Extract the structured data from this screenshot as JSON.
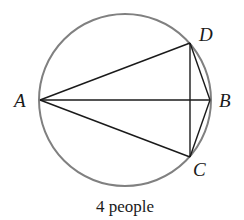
{
  "diagram": {
    "type": "geometry-circle-network",
    "circle": {
      "cx": 125,
      "cy": 100,
      "r": 86,
      "stroke": "#808080"
    },
    "points": [
      {
        "id": "A",
        "label": "A",
        "x": 40,
        "y": 100,
        "lx": 14,
        "ly": 107
      },
      {
        "id": "B",
        "label": "B",
        "x": 210,
        "y": 100,
        "lx": 219,
        "ly": 107
      },
      {
        "id": "C",
        "label": "C",
        "x": 190,
        "y": 157,
        "lx": 193,
        "ly": 176
      },
      {
        "id": "D",
        "label": "D",
        "x": 190,
        "y": 43,
        "lx": 199,
        "ly": 41
      }
    ],
    "edges": [
      [
        "A",
        "B"
      ],
      [
        "A",
        "C"
      ],
      [
        "A",
        "D"
      ],
      [
        "B",
        "C"
      ],
      [
        "B",
        "D"
      ],
      [
        "C",
        "D"
      ]
    ],
    "edge_color": "#1a1a1a",
    "caption": "4 people"
  }
}
